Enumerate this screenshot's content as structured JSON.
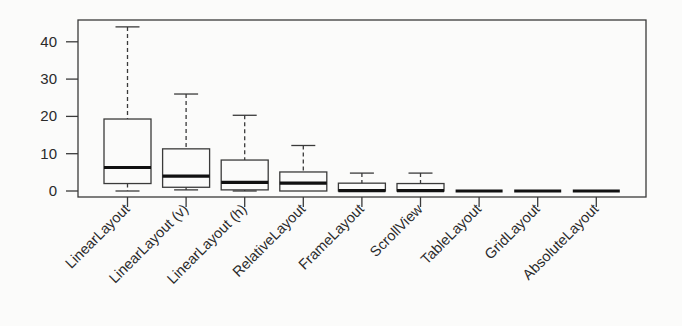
{
  "chart_data": {
    "type": "box",
    "title": "",
    "xlabel": "",
    "ylabel": "",
    "ylim": [
      0,
      45
    ],
    "yticks": [
      0,
      10,
      20,
      30,
      40
    ],
    "grid": false,
    "legend": null,
    "categories": [
      "LinearLayout",
      "LinearLayout (v)",
      "LinearLayout (h)",
      "RelativeLayout",
      "FrameLayout",
      "ScrollView",
      "TableLayout",
      "GridLayout",
      "AbsoluteLayout"
    ],
    "series": [
      {
        "name": "distribution",
        "boxes": [
          {
            "category": "LinearLayout",
            "whisker_low": 0,
            "q1": 2,
            "median": 6.3,
            "q3": 19.3,
            "whisker_high": 44
          },
          {
            "category": "LinearLayout (v)",
            "whisker_low": 0.3,
            "q1": 1,
            "median": 4,
            "q3": 11.3,
            "whisker_high": 26
          },
          {
            "category": "LinearLayout (h)",
            "whisker_low": 0,
            "q1": 0.3,
            "median": 2.3,
            "q3": 8.3,
            "whisker_high": 20.3
          },
          {
            "category": "RelativeLayout",
            "whisker_low": 0,
            "q1": 0,
            "median": 2.1,
            "q3": 5.1,
            "whisker_high": 12.2
          },
          {
            "category": "FrameLayout",
            "whisker_low": 0,
            "q1": 0,
            "median": 0.1,
            "q3": 2.1,
            "whisker_high": 4.8
          },
          {
            "category": "ScrollView",
            "whisker_low": 0,
            "q1": 0,
            "median": 0.1,
            "q3": 2.0,
            "whisker_high": 4.8
          },
          {
            "category": "TableLayout",
            "whisker_low": 0,
            "q1": 0,
            "median": 0,
            "q3": 0,
            "whisker_high": 0
          },
          {
            "category": "GridLayout",
            "whisker_low": 0,
            "q1": 0,
            "median": 0,
            "q3": 0,
            "whisker_high": 0
          },
          {
            "category": "AbsoluteLayout",
            "whisker_low": 0,
            "q1": 0,
            "median": 0,
            "q3": 0,
            "whisker_high": 0
          }
        ]
      }
    ]
  },
  "style": {
    "line_color": "#3a3a3a",
    "median_color": "#111111",
    "text_color": "#2a2a2a"
  }
}
